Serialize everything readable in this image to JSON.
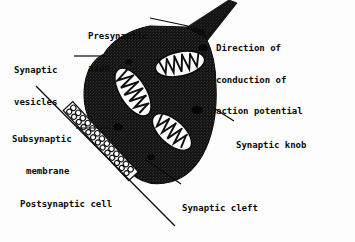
{
  "figure": {
    "background_color": "#fdfdfd",
    "ink_color": "#0a0a0a",
    "knob_fill_color": "#111111",
    "organelle_fill_color": "#ffffff"
  },
  "labels": {
    "presynaptic_axon": {
      "line1": "Presynaptic",
      "line2": "axon"
    },
    "synaptic_vesicles": {
      "line1": "Synaptic",
      "line2": "vesicles"
    },
    "direction": {
      "line1": "Direction of",
      "line2": "conduction of",
      "line3": "action potential"
    },
    "synaptic_knob": {
      "line1": "Synaptic knob"
    },
    "subsynaptic_membrane": {
      "line1": "Subsynaptic",
      "line2": "membrane"
    },
    "postsynaptic_cell": {
      "line1": "Postsynaptic cell"
    },
    "synaptic_cleft": {
      "line1": "Synaptic cleft"
    }
  },
  "structures": {
    "mitochondria_count": 3,
    "mitochondria": [
      {
        "name": "mitochondrion-upper-right",
        "cx": 180,
        "cy": 64,
        "rx": 25,
        "ry": 12,
        "rotation": -12
      },
      {
        "name": "mitochondrion-left",
        "cx": 133,
        "cy": 92,
        "rx": 26,
        "ry": 13,
        "rotation": 58
      },
      {
        "name": "mitochondrion-lower-right",
        "cx": 172,
        "cy": 132,
        "rx": 23,
        "ry": 12,
        "rotation": 42
      }
    ],
    "synaptic_cleft": {
      "name": "vesicle-band",
      "vesicle_count": 22
    },
    "leader_lines": [
      {
        "name": "leader-presynaptic-axon",
        "x1": 150,
        "y1": 18,
        "x2": 186,
        "y2": 27
      },
      {
        "name": "leader-synaptic-vesicles",
        "x1": 74,
        "y1": 56,
        "x2": 104,
        "y2": 56
      },
      {
        "name": "leader-synaptic-knob",
        "x1": 234,
        "y1": 121,
        "x2": 213,
        "y2": 108
      },
      {
        "name": "leader-subsynaptic-membrane",
        "x1": 74,
        "y1": 128,
        "x2": 108,
        "y2": 128
      },
      {
        "name": "leader-synaptic-cleft",
        "x1": 180,
        "y1": 184,
        "x2": 146,
        "y2": 160
      }
    ]
  }
}
